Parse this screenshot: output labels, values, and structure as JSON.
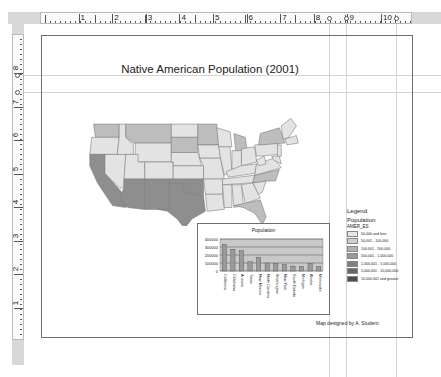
{
  "rulers": {
    "horizontal_labels": [
      "1",
      "2",
      "3",
      "4",
      "5",
      "6",
      "7",
      "8",
      "9",
      "10"
    ],
    "vertical_labels": [
      "1",
      "2",
      "3",
      "4",
      "5",
      "6",
      "7",
      "8"
    ]
  },
  "layout": {
    "title": "Native American Population (2001)",
    "credit": "Map designed by A. Student"
  },
  "legend": {
    "heading": "Legend",
    "layer": "Population",
    "field": "AMER_ES",
    "classes": [
      {
        "label": "50,000 and less",
        "color": "#e6e6e6"
      },
      {
        "label": "50,001 - 100,000",
        "color": "#cfcfcf"
      },
      {
        "label": "100,001 - 500,000",
        "color": "#b4b4b4"
      },
      {
        "label": "500,001 - 1,000,000",
        "color": "#999999"
      },
      {
        "label": "1,000,001 - 5,000,000",
        "color": "#808080"
      },
      {
        "label": "5,000,001 - 10,000,000",
        "color": "#676767"
      },
      {
        "label": "10,000,001 and greater",
        "color": "#4d4d4d"
      }
    ]
  },
  "map": {
    "colors": {
      "low": "#e3e3e3",
      "mid": "#bdbdbd",
      "high": "#8e8e8e",
      "border": "#7a7a7a"
    }
  },
  "chart_data": {
    "type": "bar",
    "title": "Population",
    "xlabel": "",
    "ylabel": "",
    "ylim": [
      0,
      400000
    ],
    "yticks": [
      "0",
      "100000",
      "200000",
      "300000",
      "400000"
    ],
    "grid": true,
    "legend": "none",
    "categories": [
      "California",
      "Oklahoma",
      "Arizona",
      "Texas",
      "New Mexico",
      "North Carolina",
      "Washington",
      "New York",
      "South Dakota",
      "Michigan",
      "Alaska",
      "Minnesota"
    ],
    "values": [
      333000,
      273000,
      256000,
      118000,
      173000,
      100000,
      93000,
      82000,
      62000,
      58000,
      98000,
      55000
    ]
  }
}
